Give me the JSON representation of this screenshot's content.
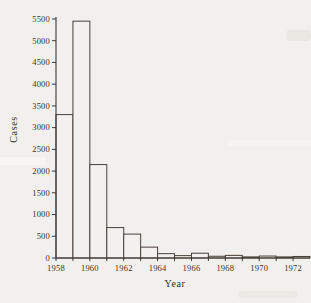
{
  "figure": {
    "kind": "scanned-textbook-histogram",
    "colors": {
      "paper": "#f2f0ec",
      "ink": "#3e3832",
      "bar_outline": "#47413a",
      "bar_fill": "#f3f1ee"
    }
  },
  "chart_data": {
    "type": "bar",
    "title": "",
    "xlabel": "Year",
    "ylabel": "Cases",
    "categories": [
      "1958",
      "1959",
      "1960",
      "1961",
      "1962",
      "1963",
      "1964",
      "1965",
      "1966",
      "1967",
      "1968",
      "1969",
      "1970",
      "1971",
      "1972"
    ],
    "values": [
      3300,
      5450,
      2150,
      700,
      550,
      250,
      100,
      55,
      110,
      40,
      60,
      25,
      45,
      25,
      35
    ],
    "ylim": [
      0,
      5500
    ],
    "ytick_step": 500,
    "ytick_labels": [
      "0",
      "500",
      "1000",
      "1500",
      "2000",
      "2500",
      "3000",
      "3500",
      "4000",
      "4500",
      "5000",
      "5500"
    ],
    "xtick_labeled_years": [
      "1958",
      "1960",
      "1962",
      "1964",
      "1966",
      "1968",
      "1970",
      "1972"
    ],
    "xtick_label_every": 2,
    "grid": false,
    "legend": false,
    "bar_style": "contiguous outlined bars, no gap, unfilled (paper-colored)"
  }
}
